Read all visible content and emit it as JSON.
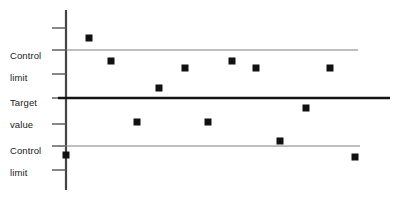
{
  "chart_data": {
    "type": "scatter",
    "title": "",
    "subtitle": "",
    "xlabel": "",
    "ylabel": "",
    "grid": false,
    "legend_position": "none",
    "xlim": [
      0,
      13
    ],
    "ylim": [
      0,
      10
    ],
    "axis": {
      "vertical_axis_x_px": 66,
      "vertical_axis_top_px": 10,
      "vertical_axis_bottom_px": 190,
      "tick_y_px": [
        28,
        50,
        74,
        98,
        124,
        146,
        170
      ],
      "tick_length_px": 14
    },
    "reference_lines": [
      {
        "name": "upper-control-limit",
        "label": "Control limit",
        "y_px": 50,
        "x_start_px": 66,
        "x_end_px": 358,
        "color": "#808080",
        "width_px": 1.2,
        "label_x_px": 10,
        "label_y_px": 39
      },
      {
        "name": "target-value",
        "label": "Target value",
        "y_px": 98,
        "x_start_px": 58,
        "x_end_px": 390,
        "color": "#141414",
        "width_px": 2.4,
        "label_x_px": 10,
        "label_y_px": 86
      },
      {
        "name": "lower-control-limit",
        "label": "Control limit",
        "y_px": 146,
        "x_start_px": 58,
        "x_end_px": 360,
        "color": "#808080",
        "width_px": 1.2,
        "label_x_px": 10,
        "label_y_px": 134
      }
    ],
    "marker": {
      "shape": "square",
      "size_px": 7,
      "fill": "#111111",
      "stroke": "none"
    },
    "series": [
      {
        "name": "Measurements",
        "color": "#111111",
        "points_px": [
          {
            "index": 1,
            "x": 66,
            "y": 155
          },
          {
            "index": 2,
            "x": 89,
            "y": 38
          },
          {
            "index": 3,
            "x": 111,
            "y": 61
          },
          {
            "index": 4,
            "x": 137,
            "y": 122
          },
          {
            "index": 5,
            "x": 159,
            "y": 88
          },
          {
            "index": 6,
            "x": 185,
            "y": 68
          },
          {
            "index": 7,
            "x": 208,
            "y": 122
          },
          {
            "index": 8,
            "x": 232,
            "y": 61
          },
          {
            "index": 9,
            "x": 256,
            "y": 68
          },
          {
            "index": 10,
            "x": 280,
            "y": 141
          },
          {
            "index": 11,
            "x": 306,
            "y": 108
          },
          {
            "index": 12,
            "x": 330,
            "y": 68
          },
          {
            "index": 13,
            "x": 355,
            "y": 157
          }
        ],
        "values": [
          1.5,
          9.0,
          7.6,
          3.6,
          5.6,
          6.8,
          3.6,
          7.6,
          6.8,
          2.4,
          4.4,
          6.8,
          1.3
        ]
      }
    ]
  },
  "labels": {
    "upper_control_limit": {
      "line1": "Control",
      "line2": "limit"
    },
    "target_value": {
      "line1": "Target",
      "line2": "value"
    },
    "lower_control_limit": {
      "line1": "Control",
      "line2": "limit"
    }
  }
}
